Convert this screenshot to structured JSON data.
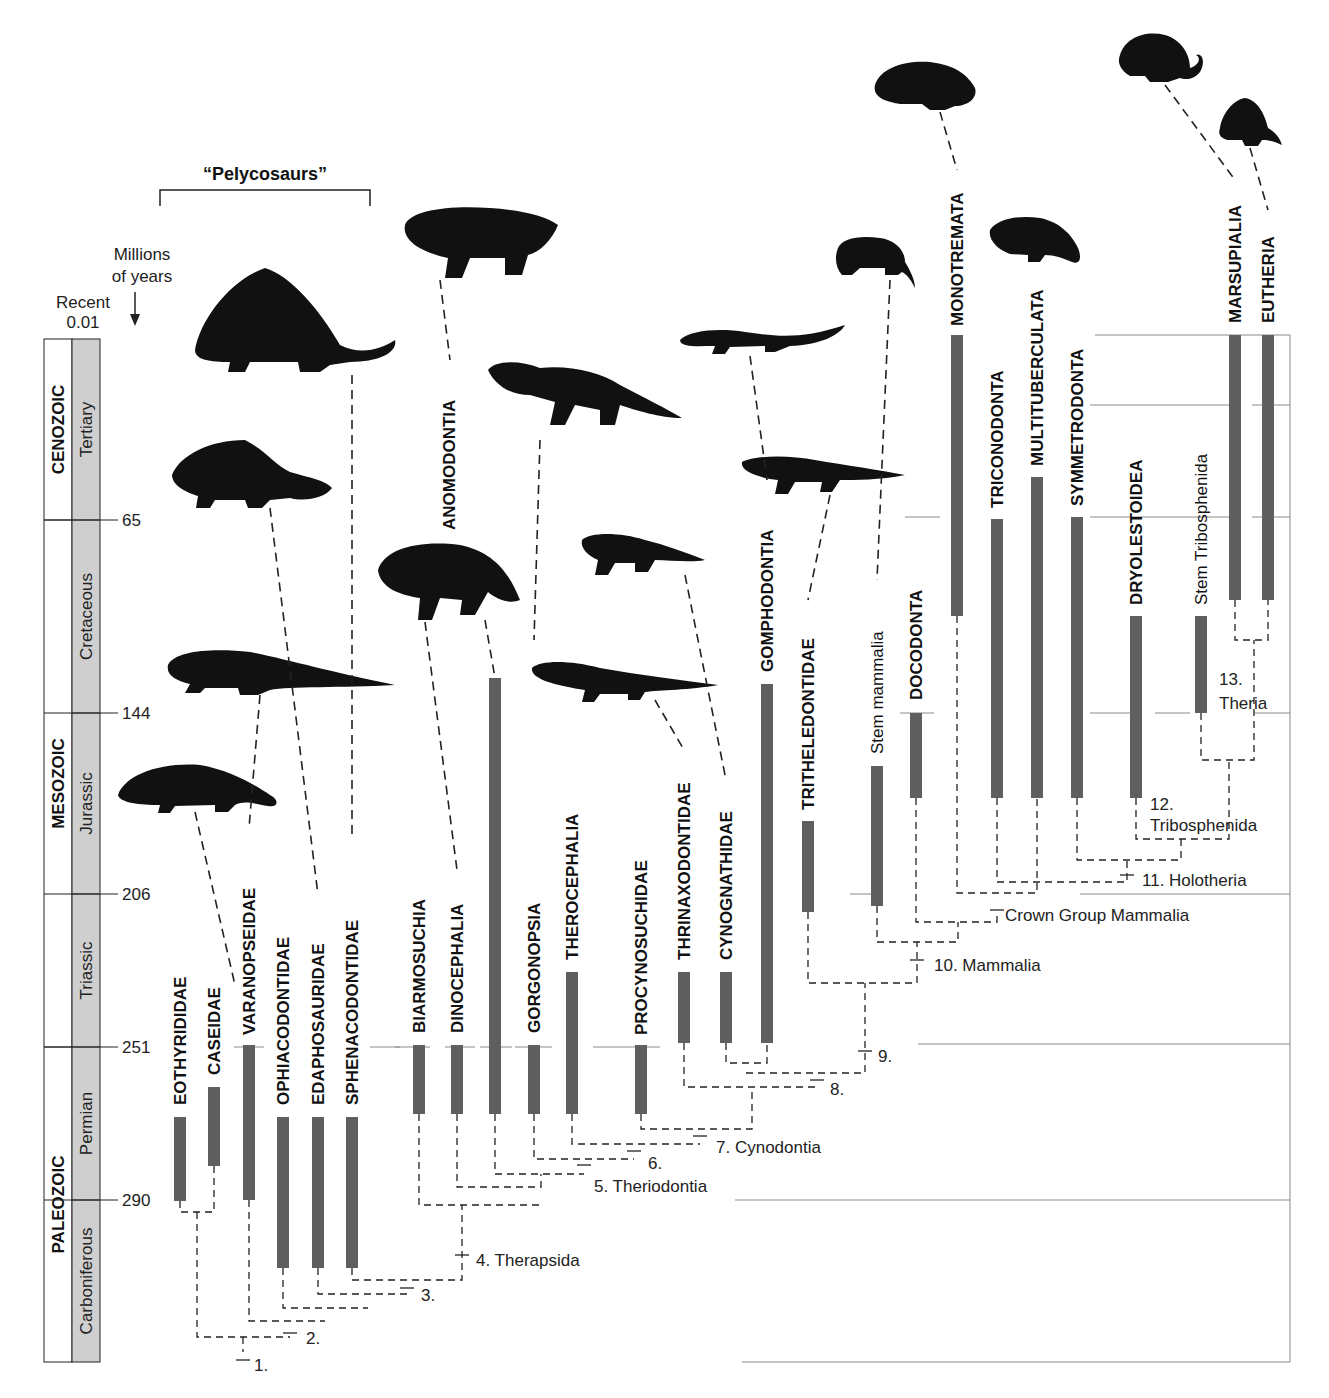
{
  "colors": {
    "bar": "#5f5f5f",
    "period_fill": "#cfcfcf",
    "line": "#222222",
    "grid": "#8a8a8a",
    "silhouette": "#111111"
  },
  "scale": {
    "header_line1": "Millions",
    "header_line2": "of years",
    "recent_label": "Recent",
    "recent_value": "0.01",
    "ticks": [
      {
        "label": "65",
        "y": 520
      },
      {
        "label": "144",
        "y": 713
      },
      {
        "label": "206",
        "y": 894
      },
      {
        "label": "251",
        "y": 1047
      },
      {
        "label": "290",
        "y": 1200
      }
    ],
    "top_y": 339,
    "bottom_y": 1362
  },
  "eras": [
    {
      "name": "CENOZOIC",
      "top": 339,
      "bottom": 520
    },
    {
      "name": "MESOZOIC",
      "top": 520,
      "bottom": 1047
    },
    {
      "name": "PALEOZOIC",
      "top": 1047,
      "bottom": 1362
    }
  ],
  "periods": [
    {
      "name": "Tertiary",
      "top": 339,
      "bottom": 520
    },
    {
      "name": "Cretaceous",
      "top": 520,
      "bottom": 713
    },
    {
      "name": "Jurassic",
      "top": 713,
      "bottom": 894
    },
    {
      "name": "Triassic",
      "top": 894,
      "bottom": 1047
    },
    {
      "name": "Permian",
      "top": 1047,
      "bottom": 1200
    },
    {
      "name": "Carboniferous",
      "top": 1200,
      "bottom": 1362
    }
  ],
  "group_bracket": {
    "label": "“Pelycosaurs”",
    "x1": 160,
    "x2": 370,
    "y": 190
  },
  "taxa": [
    {
      "name": "EOTHYRIDIDAE",
      "x": 180,
      "bar_top": 1117,
      "bar_bottom": 1201,
      "label_bottom": 1105,
      "bold": true
    },
    {
      "name": "CASEIDAE",
      "x": 214,
      "bar_top": 1087,
      "bar_bottom": 1166,
      "label_bottom": 1075,
      "bold": true
    },
    {
      "name": "VARANOPSEIDAE",
      "x": 249,
      "bar_top": 1045,
      "bar_bottom": 1200,
      "label_bottom": 1035,
      "bold": true
    },
    {
      "name": "OPHIACODONTIDAE",
      "x": 283,
      "bar_top": 1117,
      "bar_bottom": 1268,
      "label_bottom": 1105,
      "bold": true
    },
    {
      "name": "EDAPHOSAURIDAE",
      "x": 318,
      "bar_top": 1117,
      "bar_bottom": 1268,
      "label_bottom": 1105,
      "bold": true
    },
    {
      "name": "SPHENACODONTIDAE",
      "x": 352,
      "bar_top": 1117,
      "bar_bottom": 1268,
      "label_bottom": 1105,
      "bold": true
    },
    {
      "name": "BIARMOSUCHIA",
      "x": 419,
      "bar_top": 1045,
      "bar_bottom": 1114,
      "label_bottom": 1033,
      "bold": true
    },
    {
      "name": "DINOCEPHALIA",
      "x": 457,
      "bar_top": 1045,
      "bar_bottom": 1114,
      "label_bottom": 1033,
      "bold": true
    },
    {
      "name": "ANOMODONTIA",
      "x": 495,
      "bar_top": 678,
      "bar_bottom": 1114,
      "label_bottom": 530,
      "label_x": 449,
      "bold": true
    },
    {
      "name": "GORGONOPSIA",
      "x": 534,
      "bar_top": 1045,
      "bar_bottom": 1114,
      "label_bottom": 1033,
      "bold": true
    },
    {
      "name": "THEROCEPHALIA",
      "x": 572,
      "bar_top": 972,
      "bar_bottom": 1114,
      "label_bottom": 960,
      "bold": true
    },
    {
      "name": "PROCYNOSUCHIDAE",
      "x": 641,
      "bar_top": 1045,
      "bar_bottom": 1114,
      "label_bottom": 1035,
      "bold": true
    },
    {
      "name": "THRINAXODONTIDAE",
      "x": 684,
      "bar_top": 972,
      "bar_bottom": 1043,
      "label_bottom": 960,
      "bold": true
    },
    {
      "name": "CYNOGNATHIDAE",
      "x": 726,
      "bar_top": 972,
      "bar_bottom": 1043,
      "label_bottom": 960,
      "bold": true
    },
    {
      "name": "GOMPHODONTIA",
      "x": 767,
      "bar_top": 684,
      "bar_bottom": 1043,
      "label_bottom": 672,
      "bold": true
    },
    {
      "name": "TRITHELEDONTIDAE",
      "x": 808,
      "bar_top": 821,
      "bar_bottom": 912,
      "label_bottom": 810,
      "bold": true
    },
    {
      "name": "Stem mammalia",
      "x": 877,
      "bar_top": 766,
      "bar_bottom": 906,
      "label_bottom": 754,
      "bold": false
    },
    {
      "name": "DOCODONTA",
      "x": 916,
      "bar_top": 713,
      "bar_bottom": 798,
      "label_bottom": 700,
      "bold": true
    },
    {
      "name": "MONOTREMATA",
      "x": 957,
      "bar_top": 335,
      "bar_bottom": 616,
      "label_bottom": 326,
      "bold": true
    },
    {
      "name": "TRICONODONTA",
      "x": 997,
      "bar_top": 519,
      "bar_bottom": 798,
      "label_bottom": 508,
      "bold": true
    },
    {
      "name": "MULTITUBERCULATA",
      "x": 1037,
      "bar_top": 477,
      "bar_bottom": 798,
      "label_bottom": 466,
      "bold": true
    },
    {
      "name": "SYMMETRODONTA",
      "x": 1077,
      "bar_top": 517,
      "bar_bottom": 798,
      "label_bottom": 506,
      "bold": true
    },
    {
      "name": "DRYOLESTOIDEA",
      "x": 1136,
      "bar_top": 616,
      "bar_bottom": 798,
      "label_bottom": 605,
      "bold": true
    },
    {
      "name": "Stem Tribosphenida",
      "x": 1201,
      "bar_top": 616,
      "bar_bottom": 713,
      "label_bottom": 605,
      "bold": false
    },
    {
      "name": "MARSUPIALIA",
      "x": 1235,
      "bar_top": 335,
      "bar_bottom": 600,
      "label_bottom": 323,
      "bold": true
    },
    {
      "name": "EUTHERIA",
      "x": 1268,
      "bar_top": 335,
      "bar_bottom": 600,
      "label_bottom": 323,
      "bold": true
    }
  ],
  "nodes": [
    {
      "id": "1",
      "label": "1.",
      "x": 243,
      "y": 1360,
      "lx": 254,
      "ly": 1366
    },
    {
      "id": "2",
      "label": "2.",
      "x": 290,
      "y": 1333,
      "lx": 306,
      "ly": 1339
    },
    {
      "id": "3",
      "label": "3.",
      "x": 407,
      "y": 1288,
      "lx": 421,
      "ly": 1296
    },
    {
      "id": "4",
      "label": "4. Therapsida",
      "x": 462,
      "y": 1255,
      "lx": 476,
      "ly": 1261
    },
    {
      "id": "5",
      "label": "5. Theriodontia",
      "x": 584,
      "y": 1165,
      "lx": 594,
      "ly": 1187
    },
    {
      "id": "6",
      "label": "6.",
      "x": 634,
      "y": 1151,
      "lx": 648,
      "ly": 1164
    },
    {
      "id": "7",
      "label": "7. Cynodontia",
      "x": 700,
      "y": 1136,
      "lx": 716,
      "ly": 1148
    },
    {
      "id": "8",
      "label": "8.",
      "x": 817,
      "y": 1080,
      "lx": 830,
      "ly": 1090
    },
    {
      "id": "9",
      "label": "9.",
      "x": 865,
      "y": 1051,
      "lx": 878,
      "ly": 1057
    },
    {
      "id": "10",
      "label": "10. Mammalia",
      "x": 917,
      "y": 960,
      "lx": 934,
      "ly": 966
    },
    {
      "id": "crown",
      "label": "Crown Group Mammalia",
      "x": 997,
      "y": 910,
      "lx": 1005,
      "ly": 916
    },
    {
      "id": "11",
      "label": "11. Holotheria",
      "x": 1127,
      "y": 875,
      "lx": 1142,
      "ly": 881
    },
    {
      "id": "12a",
      "label": "12.",
      "x": 1150,
      "y": 805,
      "lx": 1150,
      "ly": 805
    },
    {
      "id": "12b",
      "label": "Tribosphenida",
      "x": 1136,
      "y": 826,
      "lx": 1150,
      "ly": 826
    },
    {
      "id": "13a",
      "label": "13.",
      "x": 1219,
      "y": 680,
      "lx": 1219,
      "ly": 680
    },
    {
      "id": "13b",
      "label": "Theria",
      "x": 1219,
      "y": 704,
      "lx": 1219,
      "ly": 704
    }
  ],
  "silhouettes": [
    {
      "name": "dimetrodon-silhouette",
      "cx": 290,
      "cy": 325
    },
    {
      "name": "edaphosaurus-silhouette",
      "cx": 250,
      "cy": 475
    },
    {
      "name": "ophiacodon-silhouette",
      "cx": 280,
      "cy": 670
    },
    {
      "name": "varanops-silhouette",
      "cx": 195,
      "cy": 790
    },
    {
      "name": "anomodont-silhouette",
      "cx": 480,
      "cy": 232
    },
    {
      "name": "gorgonopsid-silhouette",
      "cx": 580,
      "cy": 390
    },
    {
      "name": "dinocephalian-silhouette",
      "cx": 450,
      "cy": 575
    },
    {
      "name": "cynodont-silhouette",
      "cx": 620,
      "cy": 555
    },
    {
      "name": "thrinaxodon-silhouette",
      "cx": 620,
      "cy": 680
    },
    {
      "name": "gomphodont-silhouette",
      "cx": 760,
      "cy": 335
    },
    {
      "name": "tritheledont-silhouette",
      "cx": 820,
      "cy": 470
    },
    {
      "name": "morganucodon-silhouette",
      "cx": 870,
      "cy": 255
    },
    {
      "name": "echidna-silhouette",
      "cx": 915,
      "cy": 80
    },
    {
      "name": "multituberculate-silhouette",
      "cx": 1035,
      "cy": 232
    },
    {
      "name": "opossum-silhouette",
      "cx": 1155,
      "cy": 65
    },
    {
      "name": "shrew-silhouette",
      "cx": 1245,
      "cy": 125
    }
  ]
}
